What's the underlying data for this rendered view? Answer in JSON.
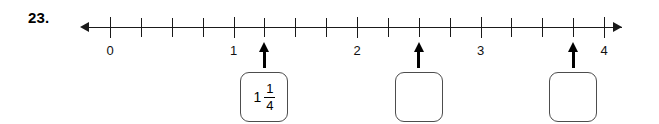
{
  "question": {
    "number_label": "23."
  },
  "number_line": {
    "start": 0,
    "end": 4,
    "tick_step": 0.25,
    "left_arrow_icon": "left-arrow-icon",
    "right_arrow_icon": "right-arrow-icon",
    "major_labels": [
      {
        "value": 0,
        "label": "0"
      },
      {
        "value": 1,
        "label": "1"
      },
      {
        "value": 2,
        "label": "2"
      },
      {
        "value": 3,
        "label": "3"
      },
      {
        "value": 4,
        "label": "4"
      }
    ],
    "ticks": [
      0,
      0.25,
      0.5,
      0.75,
      1,
      1.25,
      1.5,
      1.75,
      2,
      2.25,
      2.5,
      2.75,
      3,
      3.25,
      3.5,
      3.75,
      4
    ],
    "line_color": "#1a1a1a"
  },
  "pointers": [
    {
      "id": "pointer-1",
      "value": 1.25,
      "icon": "up-arrow-icon"
    },
    {
      "id": "pointer-2",
      "value": 2.5,
      "icon": "up-arrow-icon"
    },
    {
      "id": "pointer-3",
      "value": 3.75,
      "icon": "up-arrow-icon"
    }
  ],
  "answer_boxes": [
    {
      "id": "answer-box-1",
      "value": 1.25,
      "filled": true,
      "whole": "1",
      "numerator": "1",
      "denominator": "4"
    },
    {
      "id": "answer-box-2",
      "value": 2.5,
      "filled": false,
      "whole": "",
      "numerator": "",
      "denominator": ""
    },
    {
      "id": "answer-box-3",
      "value": 3.75,
      "filled": false,
      "whole": "",
      "numerator": "",
      "denominator": ""
    }
  ],
  "geometry": {
    "origin_x": 110,
    "unit_px": 123.5,
    "axis_y": 27
  }
}
